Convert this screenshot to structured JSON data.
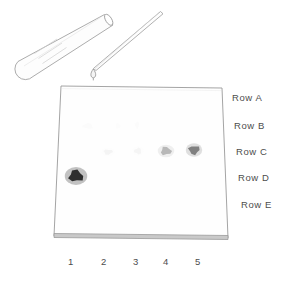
{
  "figure": {
    "kind": "tlc-chromatography-plate-diagram",
    "background_color": "#ffffff",
    "ink_color": "#8c8c8c",
    "label_color": "#4d4d4d"
  },
  "plate": {
    "name": "tlc-plate",
    "top_left": [
      61,
      86
    ],
    "top_right": [
      222,
      88
    ],
    "bottom_right": [
      228,
      238
    ],
    "bottom_left": [
      54,
      236
    ],
    "edge_color": "#9a9a9a",
    "face_color": "#fefefe",
    "base_band_color": "#b4b4b4"
  },
  "apparatus": {
    "test_tube": {
      "label": "test-tube",
      "color": "#a0a0a0"
    },
    "capillary_tube": {
      "label": "capillary-tube",
      "color": "#a0a0a0"
    },
    "droplet": {
      "label": "solvent-droplet",
      "color": "#9a9a9a",
      "position": [
        93,
        74
      ]
    }
  },
  "row_labels": [
    {
      "text": "Row A",
      "x": 232,
      "y": 92
    },
    {
      "text": "Row B",
      "x": 234,
      "y": 120
    },
    {
      "text": "Row C",
      "x": 236,
      "y": 146
    },
    {
      "text": "Row D",
      "x": 238,
      "y": 172
    },
    {
      "text": "Row E",
      "x": 241,
      "y": 199
    }
  ],
  "column_labels": [
    {
      "text": "1",
      "x": 64,
      "y": 256
    },
    {
      "text": "2",
      "x": 97,
      "y": 256
    },
    {
      "text": "3",
      "x": 129,
      "y": 256
    },
    {
      "text": "4",
      "x": 159,
      "y": 256
    },
    {
      "text": "5",
      "x": 191,
      "y": 256
    }
  ],
  "chart_data": {
    "type": "heatmap",
    "title": "",
    "xlabel": "",
    "ylabel": "",
    "categories": [
      "1",
      "2",
      "3",
      "4",
      "5"
    ],
    "rows": [
      "Row A",
      "Row B",
      "Row C",
      "Row D",
      "Row E"
    ],
    "legend": [],
    "grid": false,
    "note": "Spot intensity 0 = no spot, 1 = darkest visible spot",
    "series": [
      {
        "name": "Row A",
        "values": [
          0,
          0,
          0,
          0,
          0
        ]
      },
      {
        "name": "Row B",
        "values": [
          0,
          0.05,
          0.04,
          0.05,
          0
        ]
      },
      {
        "name": "Row C",
        "values": [
          0,
          0.12,
          0.1,
          0.45,
          0.7
        ]
      },
      {
        "name": "Row D",
        "values": [
          0.95,
          0,
          0,
          0,
          0
        ]
      },
      {
        "name": "Row E",
        "values": [
          0,
          0,
          0,
          0,
          0
        ]
      }
    ],
    "spots": [
      {
        "row": "Row D",
        "column": "1",
        "cx": 76,
        "cy": 176,
        "rx": 7.5,
        "ry": 6.0,
        "intensity": 0.95,
        "color": "#2e2e2e"
      },
      {
        "row": "Row C",
        "column": "2",
        "cx": 108,
        "cy": 152,
        "rx": 4.5,
        "ry": 2.8,
        "intensity": 0.12,
        "color": "#d8d8d8"
      },
      {
        "row": "Row C",
        "column": "3",
        "cx": 138,
        "cy": 151,
        "rx": 3.8,
        "ry": 3.2,
        "intensity": 0.1,
        "color": "#dcdcdc"
      },
      {
        "row": "Row C",
        "column": "4",
        "cx": 166,
        "cy": 151,
        "rx": 5.5,
        "ry": 4.2,
        "intensity": 0.45,
        "color": "#8f8f8f"
      },
      {
        "row": "Row C",
        "column": "5",
        "cx": 194,
        "cy": 150,
        "rx": 5.5,
        "ry": 4.5,
        "intensity": 0.7,
        "color": "#6b6b6b"
      },
      {
        "row": "Row B",
        "column": "2",
        "cx": 88,
        "cy": 126,
        "rx": 5.5,
        "ry": 3.0,
        "intensity": 0.05,
        "color": "#f0f0f0"
      },
      {
        "row": "Row B",
        "column": "3",
        "cx": 118,
        "cy": 126,
        "rx": 2.5,
        "ry": 3.0,
        "intensity": 0.04,
        "color": "#f2f2f2"
      },
      {
        "row": "Row B",
        "column": "4",
        "cx": 137,
        "cy": 125,
        "rx": 2.2,
        "ry": 3.5,
        "intensity": 0.05,
        "color": "#f0f0f0"
      }
    ]
  }
}
